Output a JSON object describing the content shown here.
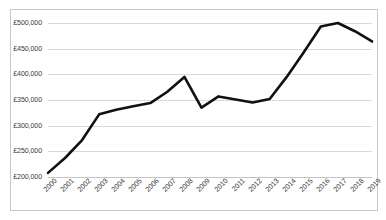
{
  "chart_data": {
    "type": "line",
    "title": "",
    "xlabel": "",
    "ylabel": "",
    "categories": [
      "2000",
      "2001",
      "2002",
      "2003",
      "2004",
      "2005",
      "2006",
      "2007",
      "2008",
      "2009",
      "2010",
      "2011",
      "2012",
      "2013",
      "2014",
      "2015",
      "2016",
      "2017",
      "2018",
      "2019"
    ],
    "values": [
      208000,
      237000,
      272000,
      322000,
      331000,
      338000,
      344000,
      366000,
      395000,
      335000,
      357000,
      351000,
      345000,
      352000,
      395000,
      443000,
      493000,
      500000,
      484000,
      464000
    ],
    "series": [
      {
        "name": "Average price",
        "values": [
          208000,
          237000,
          272000,
          322000,
          331000,
          338000,
          344000,
          366000,
          395000,
          335000,
          357000,
          351000,
          345000,
          352000,
          395000,
          443000,
          493000,
          500000,
          484000,
          464000
        ]
      }
    ],
    "ylim": [
      200000,
      500000
    ],
    "ytick_values": [
      200000,
      250000,
      300000,
      350000,
      400000,
      450000,
      500000
    ],
    "ytick_labels": [
      "£200,000",
      "£250,000",
      "£300,000",
      "£350,000",
      "£400,000",
      "£450,000",
      "£500,000"
    ],
    "currency_symbol": "£",
    "grid": true,
    "grid_axis": "y",
    "legend": false,
    "legend_position": "none",
    "line_color": "#111111",
    "line_width": 2.6,
    "grid_color": "#d9d9d9",
    "border_color": "#c9c9c9",
    "background_color": "#ffffff",
    "xtick_rotation": -45
  }
}
